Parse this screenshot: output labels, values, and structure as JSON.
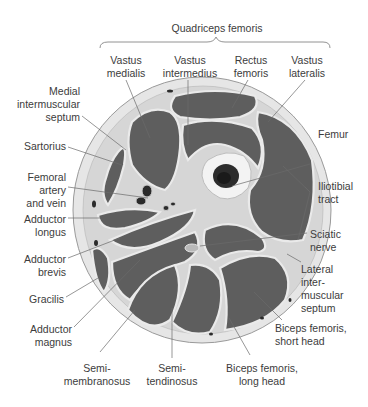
{
  "figure": {
    "group_label": "Quadriceps femoris",
    "labels": {
      "vastus_medialis": [
        "Vastus",
        "medialis"
      ],
      "vastus_intermedius": [
        "Vastus",
        "intermedius"
      ],
      "rectus_femoris": [
        "Rectus",
        "femoris"
      ],
      "vastus_lateralis": [
        "Vastus",
        "lateralis"
      ],
      "medial_septum": [
        "Medial",
        "intermuscular",
        "septum"
      ],
      "sartorius": [
        "Sartorius"
      ],
      "femoral_vessels": [
        "Femoral",
        "artery",
        "and vein"
      ],
      "adductor_longus": [
        "Adductor",
        "longus"
      ],
      "adductor_brevis": [
        "Adductor",
        "brevis"
      ],
      "gracilis": [
        "Gracilis"
      ],
      "adductor_magnus": [
        "Adductor",
        "magnus"
      ],
      "semimembranosus": [
        "Semi-",
        "membranosus"
      ],
      "semitendinosus": [
        "Semi-",
        "tendinosus"
      ],
      "biceps_long": [
        "Biceps femoris,",
        "long head"
      ],
      "biceps_short": [
        "Biceps femoris,",
        "short head"
      ],
      "lateral_septum": [
        "Lateral",
        "inter-",
        "muscular",
        "septum"
      ],
      "sciatic_nerve": [
        "Sciatic",
        "nerve"
      ],
      "iliotibial_tract": [
        "Iliotibial",
        "tract"
      ],
      "femur": [
        "Femur"
      ]
    },
    "colors": {
      "skin": "#e4e4e4",
      "fat": "#d2d2d2",
      "muscle": "#5f5f5f",
      "fascia": "#efefef",
      "bone": "#f2f2f2",
      "marrow": "#2a2a2a",
      "leader": "#6a6a6a"
    }
  }
}
